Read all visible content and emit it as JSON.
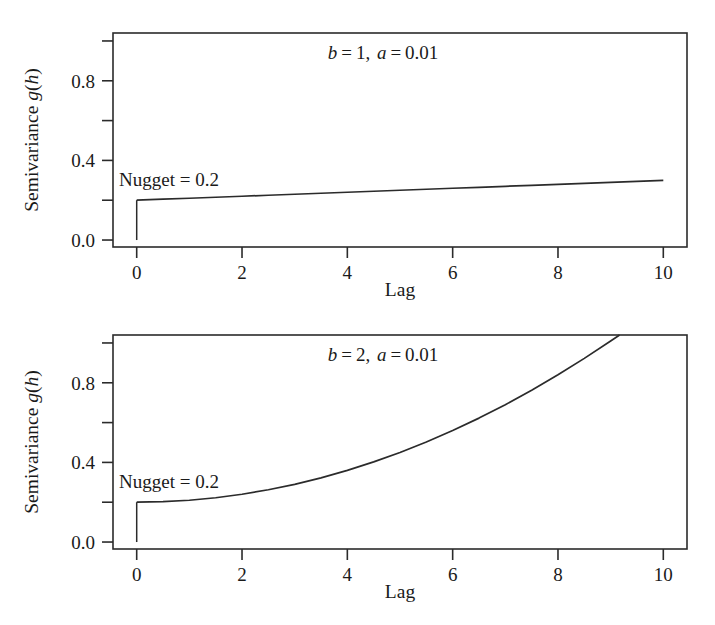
{
  "figure": {
    "background_color": "#ffffff",
    "ink_color": "#2b2b2b",
    "panel_count": 2
  },
  "chart_data": [
    {
      "id": "panel-top",
      "type": "line",
      "title": "b = 1, a = 0.01",
      "title_parts": {
        "b_symbol": "b",
        "b_value": "1",
        "a_symbol": "a",
        "a_value": "0.01",
        "eq": "=",
        "sep": ", "
      },
      "xlabel": "Lag",
      "ylabel": "Semivariance g(h)",
      "ylabel_parts": {
        "prefix": "Semivariance ",
        "g_symbol": "g",
        "open": "(",
        "h_symbol": "h",
        "close": ")"
      },
      "xlim": [
        -0.45,
        10.45
      ],
      "ylim": [
        -0.035,
        1.04
      ],
      "xticks": [
        0,
        2,
        4,
        6,
        8,
        10
      ],
      "xtick_labels": [
        "0",
        "2",
        "4",
        "6",
        "8",
        "10"
      ],
      "yticks": [
        0.0,
        0.4,
        0.8
      ],
      "ytick_labels": [
        "0.0",
        "0.4",
        "0.8"
      ],
      "yticks_minor": [
        0.2,
        0.6,
        1.0
      ],
      "grid": false,
      "legend": null,
      "annotations": [
        {
          "name": "nugget-label",
          "text": "Nugget = 0.2",
          "x": 0.15,
          "y": 0.345
        }
      ],
      "model": {
        "nugget": 0.2,
        "a": 0.01,
        "b": 1
      },
      "nugget_jump": {
        "x": 0.0,
        "y_from": 0.0,
        "y_to": 0.2
      },
      "x": [
        0.0,
        0.5,
        1.0,
        1.5,
        2.0,
        2.5,
        3.0,
        3.5,
        4.0,
        4.5,
        5.0,
        5.5,
        6.0,
        6.5,
        7.0,
        7.5,
        8.0,
        8.5,
        9.0,
        9.5,
        10.0
      ],
      "y": [
        0.2,
        0.205,
        0.21,
        0.215,
        0.22,
        0.225,
        0.23,
        0.235,
        0.24,
        0.245,
        0.25,
        0.255,
        0.26,
        0.265,
        0.27,
        0.275,
        0.28,
        0.285,
        0.29,
        0.295,
        0.3
      ]
    },
    {
      "id": "panel-bot",
      "type": "line",
      "title": "b = 2, a = 0.01",
      "title_parts": {
        "b_symbol": "b",
        "b_value": "2",
        "a_symbol": "a",
        "a_value": "0.01",
        "eq": "=",
        "sep": ", "
      },
      "xlabel": "Lag",
      "ylabel": "Semivariance g(h)",
      "ylabel_parts": {
        "prefix": "Semivariance ",
        "g_symbol": "g",
        "open": "(",
        "h_symbol": "h",
        "close": ")"
      },
      "xlim": [
        -0.45,
        10.45
      ],
      "ylim": [
        -0.035,
        1.04
      ],
      "xticks": [
        0,
        2,
        4,
        6,
        8,
        10
      ],
      "xtick_labels": [
        "0",
        "2",
        "4",
        "6",
        "8",
        "10"
      ],
      "yticks": [
        0.0,
        0.4,
        0.8
      ],
      "ytick_labels": [
        "0.0",
        "0.4",
        "0.8"
      ],
      "yticks_minor": [
        0.2,
        0.6,
        1.0
      ],
      "grid": false,
      "legend": null,
      "annotations": [
        {
          "name": "nugget-label",
          "text": "Nugget = 0.2",
          "x": 0.15,
          "y": 0.345
        }
      ],
      "model": {
        "nugget": 0.2,
        "a": 0.01,
        "b": 2
      },
      "nugget_jump": {
        "x": 0.0,
        "y_from": 0.0,
        "y_to": 0.2
      },
      "x": [
        0.0,
        0.5,
        1.0,
        1.5,
        2.0,
        2.5,
        3.0,
        3.5,
        4.0,
        4.5,
        5.0,
        5.5,
        6.0,
        6.5,
        7.0,
        7.5,
        8.0,
        8.5,
        9.0,
        9.17
      ],
      "y": [
        0.2,
        0.2025,
        0.21,
        0.2225,
        0.24,
        0.2625,
        0.29,
        0.3225,
        0.36,
        0.4025,
        0.45,
        0.5025,
        0.56,
        0.6225,
        0.69,
        0.7625,
        0.84,
        0.9225,
        1.01,
        1.041
      ]
    }
  ]
}
